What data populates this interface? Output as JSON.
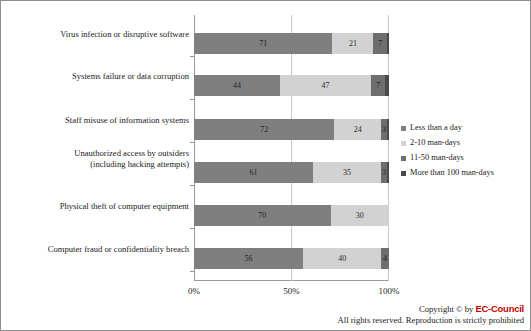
{
  "chart_data": {
    "type": "bar",
    "orientation": "horizontal",
    "stacked": true,
    "normalized_percent": true,
    "title": "",
    "subtitle": "",
    "xlabel": "",
    "ylabel": "",
    "xlim": [
      0,
      100
    ],
    "xticks": [
      "0%",
      "50%",
      "100%"
    ],
    "xtick_values": [
      0,
      50,
      100
    ],
    "grid": true,
    "grid_axis": "x",
    "legend_position": "right",
    "categories": [
      "Virus infection or disruptive software",
      "Systems failure or data corruption",
      "Staff misuse of information systems",
      "Unauthorized access by outsiders (including hacking attempts)",
      "Physical theft of computer equipment",
      "Computer fraud or confidentiality breach"
    ],
    "series": [
      {
        "name": "Less than a day",
        "color": "#7f7f7f",
        "values": [
          71,
          44,
          72,
          61,
          70,
          56
        ]
      },
      {
        "name": "2-10 man-days",
        "color": "#d2d2d2",
        "values": [
          21,
          47,
          24,
          35,
          30,
          40
        ]
      },
      {
        "name": "11-50 man-days",
        "color": "#6e6e6e",
        "values": [
          7,
          7,
          3,
          3,
          0,
          4
        ]
      },
      {
        "name": "More than 100 man-days",
        "color": "#4a4a4a",
        "values": [
          1,
          2,
          1,
          1,
          0,
          0
        ]
      }
    ]
  },
  "categories_display": [
    {
      "line1": "Virus infection or disruptive software",
      "line2": ""
    },
    {
      "line1": "Systems failure or data corruption",
      "line2": ""
    },
    {
      "line1": "Staff misuse of information systems",
      "line2": ""
    },
    {
      "line1": "Unauthorized access by outsiders",
      "line2": "(including hacking attempts)"
    },
    {
      "line1": "Physical theft of computer equipment",
      "line2": ""
    },
    {
      "line1": "Computer fraud or confidentiality breach",
      "line2": ""
    }
  ],
  "bar_rows": [
    {
      "segments": [
        {
          "value": 71,
          "label": "71",
          "series": "Less than a day"
        },
        {
          "value": 21,
          "label": "21",
          "series": "2-10 man-days"
        },
        {
          "value": 7,
          "label": "7",
          "series": "11-50 man-days"
        },
        {
          "value": 1,
          "label": "",
          "series": "More than 100 man-days"
        }
      ]
    },
    {
      "segments": [
        {
          "value": 44,
          "label": "44",
          "series": "Less than a day"
        },
        {
          "value": 47,
          "label": "47",
          "series": "2-10 man-days"
        },
        {
          "value": 7,
          "label": "7",
          "series": "11-50 man-days"
        },
        {
          "value": 2,
          "label": "",
          "series": "More than 100 man-days"
        }
      ]
    },
    {
      "segments": [
        {
          "value": 72,
          "label": "72",
          "series": "Less than a day"
        },
        {
          "value": 24,
          "label": "24",
          "series": "2-10 man-days"
        },
        {
          "value": 3,
          "label": "3",
          "series": "11-50 man-days"
        },
        {
          "value": 1,
          "label": "",
          "series": "More than 100 man-days"
        }
      ]
    },
    {
      "segments": [
        {
          "value": 61,
          "label": "61",
          "series": "Less than a day"
        },
        {
          "value": 35,
          "label": "35",
          "series": "2-10 man-days"
        },
        {
          "value": 3,
          "label": "3",
          "series": "11-50 man-days"
        },
        {
          "value": 1,
          "label": "",
          "series": "More than 100 man-days"
        }
      ]
    },
    {
      "segments": [
        {
          "value": 70,
          "label": "70",
          "series": "Less than a day"
        },
        {
          "value": 30,
          "label": "30",
          "series": "2-10 man-days"
        },
        {
          "value": 0,
          "label": "",
          "series": "11-50 man-days"
        },
        {
          "value": 0,
          "label": "",
          "series": "More than 100 man-days"
        }
      ]
    },
    {
      "segments": [
        {
          "value": 56,
          "label": "56",
          "series": "Less than a day"
        },
        {
          "value": 40,
          "label": "40",
          "series": "2-10 man-days"
        },
        {
          "value": 4,
          "label": "4",
          "series": "11-50 man-days"
        },
        {
          "value": 0,
          "label": "",
          "series": "More than 100 man-days"
        }
      ]
    }
  ],
  "legend": {
    "items": [
      {
        "label": "Less than a day",
        "color": "#7f7f7f"
      },
      {
        "label": "2-10 man-days",
        "color": "#d2d2d2"
      },
      {
        "label": "11-50 man-days",
        "color": "#6e6e6e"
      },
      {
        "label": "More than 100 man-days",
        "color": "#4a4a4a"
      }
    ]
  },
  "axis": {
    "xticks": [
      {
        "label": "0%",
        "value": 0
      },
      {
        "label": "50%",
        "value": 50
      },
      {
        "label": "100%",
        "value": 100
      }
    ]
  },
  "footer": {
    "copyright_prefix": "Copyright © by ",
    "brand": "EC-Council",
    "rights": "All rights reserved. Reproduction is strictly prohibited",
    "brand_color": "#c00000"
  }
}
